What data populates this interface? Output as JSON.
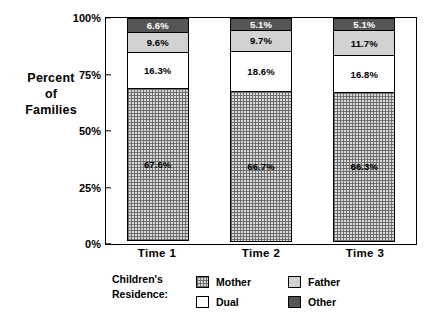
{
  "chart_data": {
    "type": "bar",
    "subtype": "100% stacked bar",
    "title": "",
    "xlabel": "",
    "ylabel": "Percent of Families",
    "ylabel_lines": [
      "Percent",
      "of",
      "Families"
    ],
    "categories": [
      "Time 1",
      "Time 2",
      "Time 3"
    ],
    "ylim": [
      0,
      100
    ],
    "yticks": [
      "0%",
      "25%",
      "50%",
      "75%",
      "100%"
    ],
    "ytick_values": [
      0,
      25,
      50,
      75,
      100
    ],
    "grid": false,
    "legend_position": "bottom",
    "legend_title": "Children's Residence:",
    "series": [
      {
        "name": "Mother",
        "pattern": "crosshatch-grid",
        "color": "#d9d9d9",
        "values": [
          67.6,
          66.7,
          66.3
        ],
        "labels": [
          "67.6%",
          "66.7%",
          "66.3%"
        ]
      },
      {
        "name": "Dual",
        "pattern": "solid-white",
        "color": "#ffffff",
        "values": [
          16.3,
          18.6,
          16.8
        ],
        "labels": [
          "16.3%",
          "18.6%",
          "16.8%"
        ]
      },
      {
        "name": "Father",
        "pattern": "solid-light-gray",
        "color": "#d2d2d2",
        "values": [
          9.6,
          9.7,
          11.7
        ],
        "labels": [
          "9.6%",
          "9.7%",
          "11.7%"
        ]
      },
      {
        "name": "Other",
        "pattern": "solid-dark-gray",
        "color": "#555555",
        "values": [
          6.6,
          5.1,
          5.1
        ],
        "labels": [
          "6.6%",
          "5.1%",
          "5.1%"
        ]
      }
    ]
  }
}
